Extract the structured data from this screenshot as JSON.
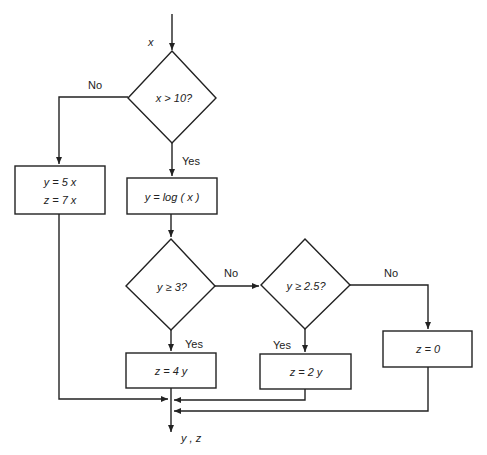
{
  "diagram": {
    "type": "flowchart",
    "input_label": "x",
    "output_label": "y , z",
    "stroke_color": "#222222",
    "nodes": {
      "decision1": {
        "text": "x > 10?"
      },
      "box_no": {
        "line1": "y = 5 x",
        "line2": "z = 7 x"
      },
      "box_log": {
        "text": "y = log ( x )"
      },
      "decision2": {
        "text": "y ≥ 3?"
      },
      "decision3": {
        "text": "y ≥ 2.5?"
      },
      "box_4y": {
        "text": "z = 4 y"
      },
      "box_2y": {
        "text": "z = 2 y"
      },
      "box_0": {
        "text": "z  =  0"
      }
    },
    "edge_labels": {
      "d1_no": "No",
      "d1_yes": "Yes",
      "d2_no": "No",
      "d2_yes": "Yes",
      "d3_no": "No",
      "d3_yes": "Yes"
    }
  }
}
